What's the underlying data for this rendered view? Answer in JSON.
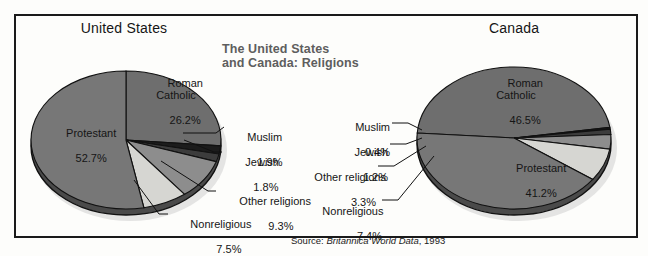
{
  "figure": {
    "title_line1": "The United States",
    "title_line2": "and Canada: Religions",
    "title_color": "#5e5e5e",
    "source_prefix": "Source: ",
    "source_italic": "Britannica World Data",
    "source_suffix": ", 1993",
    "border_color": "#1a1a1a",
    "background": "#fdfdfb"
  },
  "chart_data": [
    {
      "type": "pie",
      "title": "United States",
      "categories": [
        "Roman Catholic",
        "Muslim",
        "Jewish",
        "Other religions",
        "Nonreligious",
        "Protestant"
      ],
      "values": [
        26.2,
        1.9,
        1.8,
        9.3,
        7.5,
        52.7
      ],
      "labels": [
        "26.2%",
        "1.9%",
        "1.8%",
        "9.3%",
        "7.5%",
        "52.7%"
      ],
      "colors": [
        "#6e6e6e",
        "#1c1c1c",
        "#3c3c3c",
        "#8d8d8d",
        "#d6d6d2",
        "#777777"
      ],
      "legend": "callouts",
      "inside_labels": [
        "Roman Catholic",
        "Protestant"
      ],
      "callout_labels": [
        "Muslim",
        "Jewish",
        "Other religions",
        "Nonreligious"
      ]
    },
    {
      "type": "pie",
      "title": "Canada",
      "categories": [
        "Roman Catholic",
        "Muslim",
        "Jewish",
        "Other religions",
        "Nonreligious",
        "Protestant"
      ],
      "values": [
        46.5,
        0.4,
        1.2,
        3.3,
        7.4,
        41.2
      ],
      "labels": [
        "46.5%",
        "0.4%",
        "1.2%",
        "3.3%",
        "7.4%",
        "41.2%"
      ],
      "colors": [
        "#6e6e6e",
        "#1c1c1c",
        "#3c3c3c",
        "#8d8d8d",
        "#d6d6d2",
        "#777777"
      ],
      "legend": "callouts",
      "inside_labels": [
        "Roman Catholic",
        "Protestant"
      ],
      "callout_labels": [
        "Muslim",
        "Jewish",
        "Other religions",
        "Nonreligious"
      ]
    }
  ],
  "us": {
    "title": "United States",
    "roman_catholic_name": "Roman\nCatholic",
    "roman_catholic_pct": "26.2%",
    "protestant_name": "Protestant",
    "protestant_pct": "52.7%",
    "muslim_name": "Muslim",
    "muslim_pct": "1.9%",
    "jewish_name": "Jewish",
    "jewish_pct": "1.8%",
    "other_name": "Other religions",
    "other_pct": "9.3%",
    "nonreligious_name": "Nonreligious",
    "nonreligious_pct": "7.5%"
  },
  "canada": {
    "title": "Canada",
    "roman_catholic_name": "Roman\nCatholic",
    "roman_catholic_pct": "46.5%",
    "protestant_name": "Protestant",
    "protestant_pct": "41.2%",
    "muslim_name": "Muslim",
    "muslim_pct": "0.4%",
    "jewish_name": "Jewish",
    "jewish_pct": "1.2%",
    "other_name": "Other religions",
    "other_pct": "3.3%",
    "nonreligious_name": "Nonreligious",
    "nonreligious_pct": "7.4%"
  }
}
